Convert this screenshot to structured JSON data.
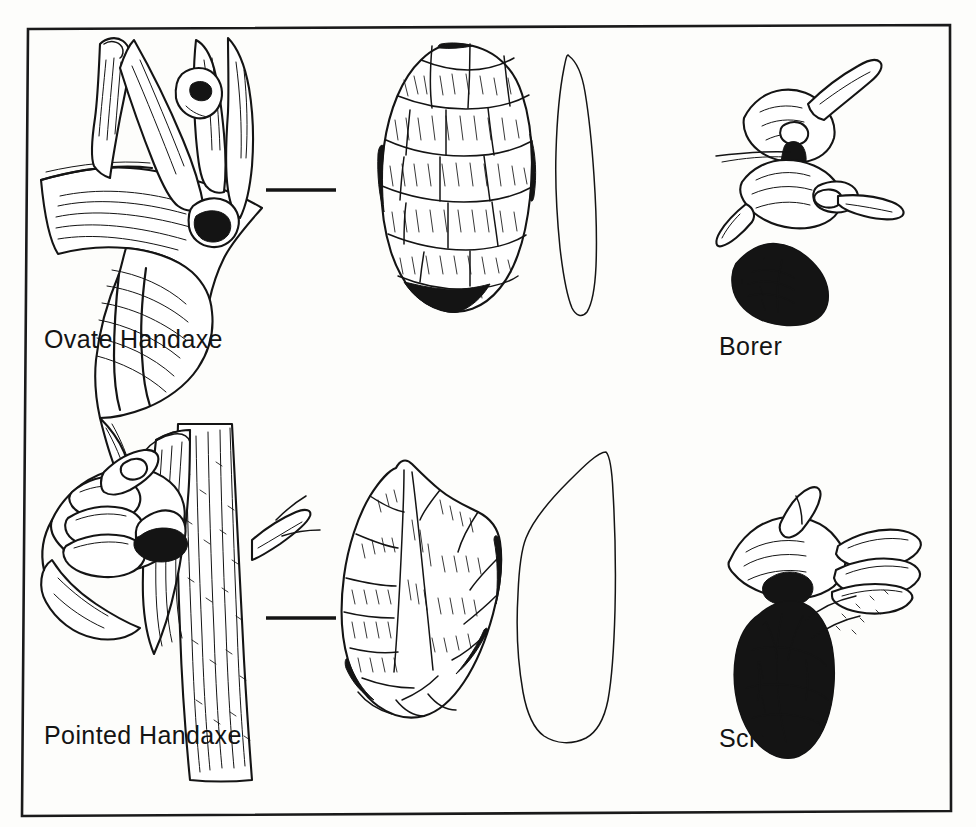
{
  "plate": {
    "background_color": "#fdfdfb",
    "ink_color": "#141414",
    "frame": {
      "name": "plate-border",
      "stroke_color": "#1a1a1a"
    }
  },
  "panels": [
    {
      "id": "ovate-handaxe",
      "label": "Ovate Handaxe",
      "use_scene": "hand-cutting-hide-with-ovate-handaxe",
      "tool_view": "ovate-handaxe-face",
      "tool_profile": "ovate-handaxe-profile",
      "separator": "dash"
    },
    {
      "id": "borer",
      "label": "Borer",
      "use_scene": "hands-boring-hole-with-borer",
      "tool_view": "borer-flake",
      "tool_profile": "",
      "separator": ""
    },
    {
      "id": "pointed-handaxe",
      "label": "Pointed Handaxe",
      "use_scene": "hand-cutting-branch-with-pointed-handaxe",
      "tool_view": "pointed-handaxe-face",
      "tool_profile": "pointed-handaxe-profile",
      "separator": "dash"
    },
    {
      "id": "scraper",
      "label": "Scraper",
      "use_scene": "hands-scraping-hide-with-scraper",
      "tool_view": "scraper-flake",
      "tool_profile": "",
      "separator": ""
    }
  ],
  "labels": {
    "ovate_handaxe": "Ovate Handaxe",
    "borer": "Borer",
    "pointed_handaxe": "Pointed Handaxe",
    "scraper": "Scraper"
  }
}
